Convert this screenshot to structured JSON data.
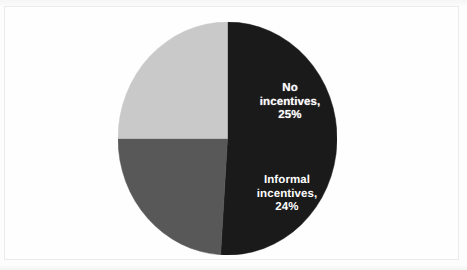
{
  "chart_data": {
    "type": "pie",
    "title": "",
    "subtitle": "",
    "xlabel": "",
    "ylabel": "",
    "legend_position": "none",
    "grid": false,
    "labels_inside_slices": true,
    "categories": [
      "Formal incentives",
      "No incentives",
      "Informal incentives"
    ],
    "values": [
      51,
      24,
      25
    ],
    "unit": "%",
    "slices": [
      {
        "name": "Formal incentives",
        "value": 51,
        "label": "Formal\nincentives,\n51%",
        "color": "#1a1a1a",
        "label_color": "#ffffff",
        "start_angle_deg": 0,
        "sweep_deg": 183.6
      },
      {
        "name": "Informal incentives",
        "value": 24,
        "label": "Informal\nincentives,\n24%",
        "color": "#585858",
        "label_color": "#ffffff",
        "start_angle_deg": 183.6,
        "sweep_deg": 86.4
      },
      {
        "name": "No incentives",
        "value": 25,
        "label": "No\nincentives,\n25%",
        "color": "#c9c9c9",
        "label_color": "#fbfbfb",
        "start_angle_deg": 270,
        "sweep_deg": 90
      }
    ]
  },
  "figure": {
    "background_color": "#fdfdfd",
    "border_color": "#ebebeb"
  }
}
